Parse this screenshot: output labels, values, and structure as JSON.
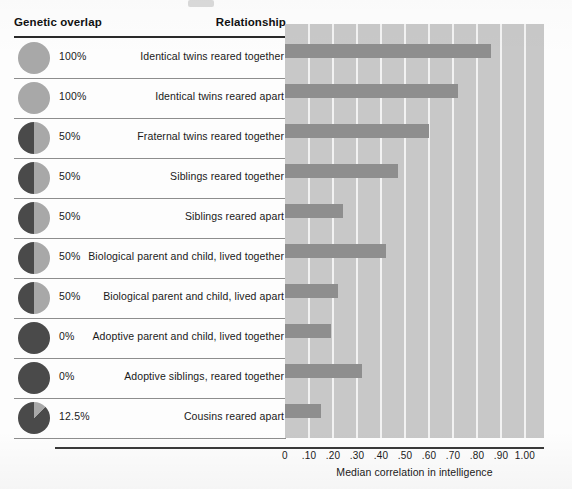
{
  "header": {
    "col_genetic": "Genetic overlap",
    "col_relationship": "Relationship"
  },
  "axis": {
    "title": "Median correlation in intelligence",
    "ticks": [
      "0",
      ".10",
      ".20",
      ".30",
      ".40",
      ".50",
      ".60",
      ".70",
      ".80",
      ".90",
      "1.00"
    ]
  },
  "colors": {
    "plot_background": "#c8c8c8",
    "gridline": "#f2f2f2",
    "bar": "#8e8e8e",
    "pie_overlap": "#a8a8a8",
    "pie_remainder": "#4a4a4a",
    "rule": "#2a2a2a"
  },
  "rows": [
    {
      "overlap": "100%",
      "overlap_fraction": 100,
      "relationship": "Identical twins reared together",
      "value": 0.86
    },
    {
      "overlap": "100%",
      "overlap_fraction": 100,
      "relationship": "Identical twins reared apart",
      "value": 0.72
    },
    {
      "overlap": "50%",
      "overlap_fraction": 50,
      "relationship": "Fraternal twins reared together",
      "value": 0.6
    },
    {
      "overlap": "50%",
      "overlap_fraction": 50,
      "relationship": "Siblings reared together",
      "value": 0.47
    },
    {
      "overlap": "50%",
      "overlap_fraction": 50,
      "relationship": "Siblings reared apart",
      "value": 0.24
    },
    {
      "overlap": "50%",
      "overlap_fraction": 50,
      "relationship": "Biological parent and child, lived together",
      "value": 0.42
    },
    {
      "overlap": "50%",
      "overlap_fraction": 50,
      "relationship": "Biological parent and child, lived apart",
      "value": 0.22
    },
    {
      "overlap": "0%",
      "overlap_fraction": 0,
      "relationship": "Adoptive parent and child, lived together",
      "value": 0.19
    },
    {
      "overlap": "0%",
      "overlap_fraction": 0,
      "relationship": "Adoptive siblings, reared together",
      "value": 0.32
    },
    {
      "overlap": "12.5%",
      "overlap_fraction": 12.5,
      "relationship": "Cousins reared apart",
      "value": 0.15
    }
  ],
  "chart_data": {
    "type": "bar",
    "orientation": "horizontal",
    "title": "",
    "xlabel": "Median correlation in intelligence",
    "ylabel": "",
    "xlim": [
      0,
      1.0
    ],
    "xticks": [
      0,
      0.1,
      0.2,
      0.3,
      0.4,
      0.5,
      0.6,
      0.7,
      0.8,
      0.9,
      1.0
    ],
    "xticklabels": [
      "0",
      ".10",
      ".20",
      ".30",
      ".40",
      ".50",
      ".60",
      ".70",
      ".80",
      ".90",
      "1.00"
    ],
    "grid": "vertical",
    "legend": "none",
    "categories": [
      "Identical twins reared together",
      "Identical twins reared apart",
      "Fraternal twins reared together",
      "Siblings reared together",
      "Siblings reared apart",
      "Biological parent and child, lived together",
      "Biological parent and child, lived apart",
      "Adoptive parent and child, lived together",
      "Adoptive siblings, reared together",
      "Cousins reared apart"
    ],
    "values": [
      0.86,
      0.72,
      0.6,
      0.47,
      0.24,
      0.42,
      0.22,
      0.19,
      0.32,
      0.15
    ],
    "annotations": {
      "genetic_overlap": [
        "100%",
        "100%",
        "50%",
        "50%",
        "50%",
        "50%",
        "50%",
        "0%",
        "0%",
        "12.5%"
      ]
    }
  }
}
